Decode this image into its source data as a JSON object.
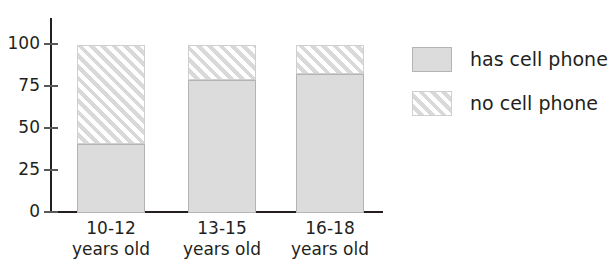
{
  "chart_data": {
    "type": "bar",
    "subtype": "stacked-bar-percent",
    "title": "",
    "xlabel": "",
    "ylabel": "",
    "ylim": [
      0,
      100
    ],
    "yticks": [
      0,
      25,
      50,
      75,
      100
    ],
    "ytick_labels": [
      "0",
      "25",
      "50",
      "75",
      "100"
    ],
    "grid": false,
    "categories": [
      "10-12\nyears old",
      "13-15\nyears old",
      "16-18\nyears old"
    ],
    "category_age_ranges": [
      "10-12",
      "13-15",
      "16-18"
    ],
    "category_suffix": "years old",
    "series": [
      {
        "name": "has cell phone",
        "values": [
          41,
          79,
          83
        ],
        "fill": "#dcdcdc",
        "pattern": "solid"
      },
      {
        "name": "no cell phone",
        "values": [
          59,
          21,
          17
        ],
        "fill": "#ffffff",
        "pattern": "diagonal-hatch"
      }
    ],
    "legend": {
      "position": "right",
      "entries": [
        {
          "label": "has cell phone",
          "pattern": "solid"
        },
        {
          "label": "no cell phone",
          "pattern": "diagonal-hatch"
        }
      ]
    },
    "colors": {
      "axis": "#231f20",
      "tick": "#58595b",
      "bar_fill": "#dcdcdc",
      "bar_border": "#b4b4b4",
      "hatch_line": "#d9d9d9",
      "background": "#ffffff",
      "text": "#231f20"
    }
  }
}
